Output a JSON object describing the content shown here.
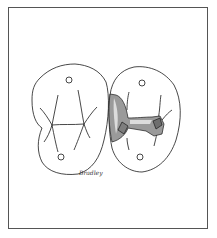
{
  "figure": {
    "type": "dental illustration",
    "signature": "Bradley",
    "colors": {
      "line": "#1a1a1a",
      "prep_fill": "#9a9a9a",
      "prep_highlight": "#dcdcdc",
      "frame": "#555555"
    }
  }
}
